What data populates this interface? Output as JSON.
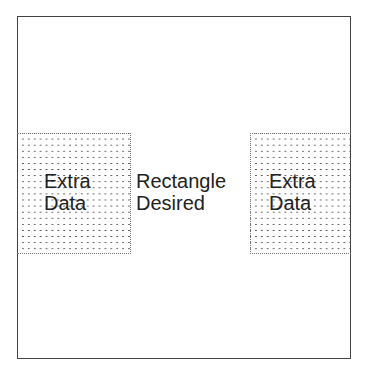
{
  "diagram": {
    "regions": [
      {
        "name": "left",
        "lines": [
          "Extra",
          "Data"
        ],
        "pattern": "dotted"
      },
      {
        "name": "center",
        "lines": [
          "Rectangle",
          "Desired"
        ],
        "pattern": "none"
      },
      {
        "name": "right",
        "lines": [
          "Extra",
          "Data"
        ],
        "pattern": "dotted"
      }
    ]
  }
}
